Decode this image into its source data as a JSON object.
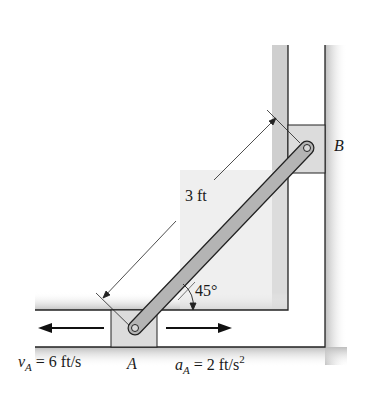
{
  "diagram": {
    "type": "mechanism",
    "rod_length_label": "3 ft",
    "angle_label": "45°",
    "point_a_label": "A",
    "point_b_label": "B",
    "velocity": {
      "symbol": "v",
      "subscript": "A",
      "rest": " = 6 ft/s"
    },
    "acceleration": {
      "symbol": "a",
      "subscript": "A",
      "rest": " = 2 ft/s",
      "superscript": "2"
    },
    "colors": {
      "guide_shadow": "#c8c8c8",
      "slider_fill": "#dcdcdc",
      "rod_fill": "#b4b4b4",
      "line": "#222222"
    }
  }
}
